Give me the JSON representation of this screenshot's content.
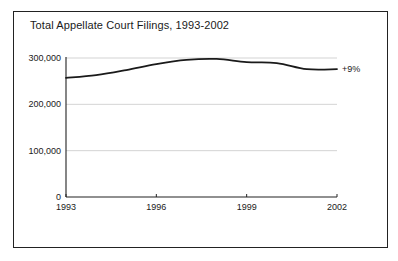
{
  "chart_data": {
    "type": "line",
    "title": "Total Appellate Court Filings, 1993-2002",
    "xlabel": "",
    "ylabel": "",
    "x": [
      1993,
      1994,
      1995,
      1996,
      1997,
      1998,
      1999,
      2000,
      2001,
      2002
    ],
    "series": [
      {
        "name": "Total Appellate Court Filings",
        "values": [
          257000,
          263000,
          274000,
          287000,
          296000,
          298000,
          291000,
          289000,
          276000,
          276000
        ]
      }
    ],
    "ylim": [
      0,
      300000
    ],
    "xlim": [
      1993,
      2002
    ],
    "y_ticks": [
      0,
      100000,
      200000,
      300000
    ],
    "y_tick_labels": [
      "0",
      "100,000",
      "200,000",
      "300,000"
    ],
    "x_ticks": [
      1993,
      1996,
      1999,
      2002
    ],
    "x_tick_labels": [
      "1993",
      "1996",
      "1999",
      "2002"
    ],
    "grid": "horizontal",
    "legend": "none",
    "annotations": [
      {
        "text": "+9%",
        "x": 2002,
        "y": 276000,
        "position": "right-of-line-end"
      }
    ]
  },
  "colors": {
    "line": "#1a1a1a",
    "grid": "#c8c8c8",
    "axis": "#222222",
    "frame": "#222222",
    "background": "#ffffff"
  }
}
